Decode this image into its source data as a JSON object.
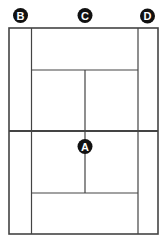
{
  "diagram": {
    "type": "tennis-court-positions",
    "colors": {
      "line": "#444444",
      "marker_fill": "#111111",
      "marker_text": "#ffffff",
      "background": "#ffffff"
    },
    "markers": [
      {
        "id": "B",
        "label": "B",
        "position": "top-left, behind baseline"
      },
      {
        "id": "C",
        "label": "C",
        "position": "top-center, behind baseline"
      },
      {
        "id": "D",
        "label": "D",
        "position": "top-right, behind baseline"
      },
      {
        "id": "A",
        "label": "A",
        "position": "center, just below net"
      }
    ]
  }
}
